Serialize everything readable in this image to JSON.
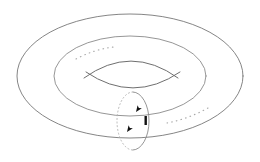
{
  "figure": {
    "background_color": "#ffffff",
    "width": 260,
    "height": 162,
    "caption": ""
  },
  "style": {
    "outer_stroke_color": "#7e7e7e",
    "inner_stroke_color": "#8a8a8a",
    "hole_stroke_color": "#6f6f6f",
    "dotted_stroke_color": "#a9a9a9",
    "hidden_stroke_color": "#b0b0b0",
    "arrow_color": "#111111",
    "stroke_width": 0.9
  },
  "shapes": {
    "outer_ellipse": {
      "name": "outer-silhouette-ellipse",
      "center_x": 130,
      "center_y": 76,
      "radius_x": 113,
      "radius_y": 62,
      "line_style": "solid"
    },
    "inner_ridge_ellipse": {
      "name": "inner-ridge-ellipse",
      "center_x": 130,
      "center_y": 76,
      "radius_x": 76,
      "radius_y": 40,
      "line_style": "solid"
    },
    "hole_upper_arc": {
      "name": "hole-upper-arc",
      "start_x": 84,
      "start_y": 78,
      "end_x": 178,
      "end_y": 78,
      "control_x": 131,
      "control_y": 47,
      "line_style": "solid"
    },
    "hole_lower_arc": {
      "name": "hole-lower-arc",
      "start_x": 86,
      "start_y": 72,
      "end_x": 180,
      "end_y": 72,
      "control_x": 133,
      "control_y": 101,
      "line_style": "solid"
    },
    "longitude_dotted_left": {
      "name": "longitude-curve-hidden-left",
      "start_x": 76,
      "start_y": 58,
      "end_x": 113,
      "end_y": 47,
      "control_x": 94,
      "control_y": 50,
      "line_style": "dotted"
    },
    "longitude_dotted_right": {
      "name": "longitude-curve-hidden-right",
      "start_x": 167,
      "start_y": 122,
      "end_x": 207,
      "end_y": 108,
      "control_x": 188,
      "control_y": 118,
      "line_style": "dotted"
    },
    "meridian_circle": {
      "name": "meridian-circle",
      "center_x": 133,
      "center_y": 121,
      "radius_x": 16,
      "radius_y": 29,
      "visible_half": "right",
      "hidden_half": "left",
      "line_style": "solid-and-dashed"
    }
  },
  "arrows": [
    {
      "name": "meridian-arrow-upper",
      "x": 135,
      "y": 112,
      "rotation_deg": 118,
      "direction": "clockwise"
    },
    {
      "name": "meridian-arrow-lower",
      "x": 128,
      "y": 131,
      "rotation_deg": 118,
      "direction": "clockwise"
    },
    {
      "name": "meridian-tick-mark",
      "x": 146,
      "y": 121,
      "rotation_deg": 0,
      "direction": "marker"
    }
  ],
  "labels": []
}
